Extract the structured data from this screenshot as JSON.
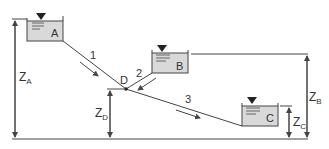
{
  "diagram": {
    "reservoirs": [
      {
        "id": "A",
        "label": "A"
      },
      {
        "id": "B",
        "label": "B"
      },
      {
        "id": "C",
        "label": "C"
      }
    ],
    "junction": {
      "id": "D",
      "label": "D"
    },
    "pipes": [
      {
        "id": "1",
        "label": "1",
        "from": "A",
        "to": "D"
      },
      {
        "id": "2",
        "label": "2",
        "from": "B",
        "to": "D"
      },
      {
        "id": "3",
        "label": "3",
        "from": "D",
        "to": "C"
      }
    ],
    "elevations": {
      "za": {
        "main": "Z",
        "sub": "A"
      },
      "zb": {
        "main": "Z",
        "sub": "B"
      },
      "zc": {
        "main": "Z",
        "sub": "C"
      },
      "zd": {
        "main": "Z",
        "sub": "D"
      }
    },
    "colors": {
      "line": "#444444",
      "tank_fill": "#d9d9d9",
      "text": "#333333"
    }
  }
}
